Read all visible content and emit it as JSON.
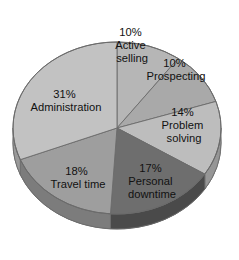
{
  "chart_data": {
    "type": "pie",
    "title": "",
    "subtitle": "",
    "xlabel": "",
    "ylabel": "",
    "legend": "none",
    "grid": false,
    "units": "percent",
    "total": 100,
    "style": "3d-pie",
    "categories": [
      "Active selling",
      "Prospecting",
      "Problem solving",
      "Personal downtime",
      "Travel time",
      "Administration"
    ],
    "values": [
      10,
      10,
      14,
      17,
      18,
      31
    ],
    "value_labels": [
      "10%",
      "10%",
      "14%",
      "17%",
      "18%",
      "31%"
    ],
    "colors": [
      "#b6b6b6",
      "#a9a9a9",
      "#bdbdbd",
      "#6e6e6e",
      "#9e9e9e",
      "#c2c2c2"
    ],
    "slices": [
      {
        "name": "Active selling",
        "value": 10,
        "pct_label": "10%",
        "label_line1": "Active",
        "label_line2": "selling",
        "color": "#b6b6b6",
        "side_color": "#8f8f8f",
        "start_angle": 0,
        "end_angle": 36
      },
      {
        "name": "Prospecting",
        "value": 10,
        "pct_label": "10%",
        "label_line1": "Prospecting",
        "label_line2": "",
        "color": "#a9a9a9",
        "side_color": "#858585",
        "start_angle": 36,
        "end_angle": 72
      },
      {
        "name": "Problem solving",
        "value": 14,
        "pct_label": "14%",
        "label_line1": "Problem",
        "label_line2": "solving",
        "color": "#bdbdbd",
        "side_color": "#969696",
        "start_angle": 72,
        "end_angle": 122.4
      },
      {
        "name": "Personal downtime",
        "value": 17,
        "pct_label": "17%",
        "label_line1": "Personal",
        "label_line2": "downtime",
        "color": "#6e6e6e",
        "side_color": "#4a4a4a",
        "start_angle": 122.4,
        "end_angle": 183.6
      },
      {
        "name": "Travel time",
        "value": 18,
        "pct_label": "18%",
        "label_line1": "Travel time",
        "label_line2": "",
        "color": "#9e9e9e",
        "side_color": "#7c7c7c",
        "start_angle": 183.6,
        "end_angle": 248.4
      },
      {
        "name": "Administration",
        "value": 31,
        "pct_label": "31%",
        "label_line1": "Administration",
        "label_line2": "",
        "color": "#c2c2c2",
        "side_color": "#9a9a9a",
        "start_angle": 248.4,
        "end_angle": 360
      }
    ]
  },
  "labels": {
    "active_selling": {
      "pct": "10%",
      "line1": "Active",
      "line2": "selling"
    },
    "prospecting": {
      "pct": "10%",
      "line1": "Prospecting",
      "line2": ""
    },
    "problem_solving": {
      "pct": "14%",
      "line1": "Problem",
      "line2": "solving"
    },
    "personal_downtime": {
      "pct": "17%",
      "line1": "Personal",
      "line2": "downtime"
    },
    "travel_time": {
      "pct": "18%",
      "line1": "Travel time",
      "line2": ""
    },
    "administration": {
      "pct": "31%",
      "line1": "Administration",
      "line2": ""
    }
  }
}
